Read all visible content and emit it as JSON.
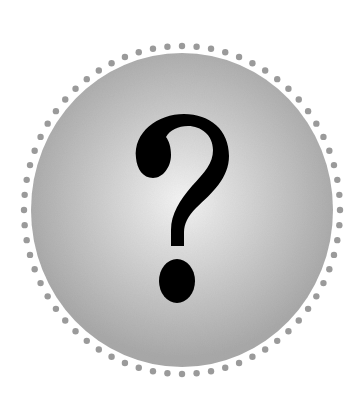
{
  "badge": {
    "symbol": "?",
    "symbol_name": "question-mark",
    "dot_count": 68,
    "colors": {
      "background": "#ffffff",
      "disc_center": "#f4f4f4",
      "disc_mid": "#d2d2d2",
      "disc_edge": "#a9a9a9",
      "dots": "#9a9a9a",
      "symbol": "#000000"
    }
  }
}
